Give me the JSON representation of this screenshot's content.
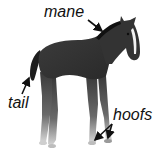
{
  "diagram": {
    "labels": [
      {
        "id": "mane",
        "text": "mane"
      },
      {
        "id": "tail",
        "text": "tail"
      },
      {
        "id": "hoofs",
        "text": "hoofs"
      }
    ]
  },
  "colors": {
    "background": "#ffffff",
    "text": "#111111",
    "arrow": "#111111",
    "horse_dark": "#2a2a2a",
    "horse_mid": "#4a4a4a",
    "blaze": "#f2f2f2"
  }
}
